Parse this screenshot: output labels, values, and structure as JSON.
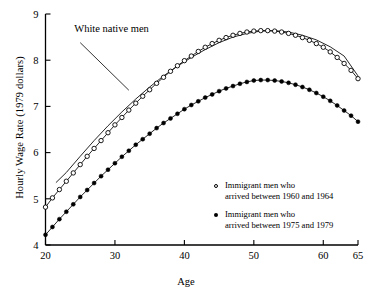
{
  "chart_data": {
    "type": "line",
    "title": "",
    "xlabel": "Age",
    "ylabel": "Hourly Wage Rate (1979 dollars)",
    "xlim": [
      20,
      65
    ],
    "ylim": [
      4,
      9
    ],
    "xticks": [
      20,
      30,
      40,
      50,
      60,
      65
    ],
    "yticks": [
      4,
      5,
      6,
      7,
      8,
      9
    ],
    "grid": false,
    "legend_position": "lower-right inside",
    "annotations": [
      {
        "text": "White native men",
        "x": 25.0,
        "y": 8.38,
        "points_to": {
          "x": 32.0,
          "y": 7.35
        }
      }
    ],
    "series": [
      {
        "name": "White native men",
        "marker": "none",
        "style": "solid-line",
        "x": [
          21.5,
          23,
          25,
          27,
          29,
          31,
          33,
          35,
          37,
          39,
          41,
          43,
          45,
          47,
          49,
          51,
          53,
          55,
          57,
          59,
          61,
          63,
          65
        ],
        "y": [
          5.35,
          5.57,
          5.92,
          6.26,
          6.58,
          6.88,
          7.16,
          7.42,
          7.66,
          7.87,
          8.06,
          8.23,
          8.38,
          8.5,
          8.58,
          8.63,
          8.64,
          8.61,
          8.54,
          8.44,
          8.29,
          8.09,
          7.66
        ]
      },
      {
        "name": "Immigrant men who arrived between 1960 and 1964",
        "marker": "open-circle",
        "style": "solid-line-with-markers",
        "x": [
          20,
          21,
          22,
          23,
          24,
          25,
          26,
          27,
          28,
          29,
          30,
          31,
          32,
          33,
          34,
          35,
          36,
          37,
          38,
          39,
          40,
          41,
          42,
          43,
          44,
          45,
          46,
          47,
          48,
          49,
          50,
          51,
          52,
          53,
          54,
          55,
          56,
          57,
          58,
          59,
          60,
          61,
          62,
          63,
          64,
          65
        ],
        "y": [
          4.82,
          5.02,
          5.2,
          5.38,
          5.56,
          5.74,
          5.92,
          6.09,
          6.26,
          6.43,
          6.6,
          6.76,
          6.92,
          7.07,
          7.22,
          7.36,
          7.5,
          7.63,
          7.76,
          7.88,
          7.99,
          8.09,
          8.19,
          8.28,
          8.36,
          8.43,
          8.49,
          8.54,
          8.58,
          8.61,
          8.63,
          8.64,
          8.64,
          8.63,
          8.61,
          8.58,
          8.54,
          8.49,
          8.43,
          8.36,
          8.28,
          8.18,
          8.06,
          7.93,
          7.78,
          7.6
        ]
      },
      {
        "name": "Immigrant men who arrived between 1975 and 1979",
        "marker": "filled-circle",
        "style": "solid-line-with-markers",
        "x": [
          20,
          21,
          22,
          23,
          24,
          25,
          26,
          27,
          28,
          29,
          30,
          31,
          32,
          33,
          34,
          35,
          36,
          37,
          38,
          39,
          40,
          41,
          42,
          43,
          44,
          45,
          46,
          47,
          48,
          49,
          50,
          51,
          52,
          53,
          54,
          55,
          56,
          57,
          58,
          59,
          60,
          61,
          62,
          63,
          64,
          65
        ],
        "y": [
          4.22,
          4.39,
          4.56,
          4.72,
          4.88,
          5.04,
          5.19,
          5.34,
          5.49,
          5.63,
          5.77,
          5.91,
          6.04,
          6.17,
          6.29,
          6.41,
          6.53,
          6.64,
          6.74,
          6.84,
          6.94,
          7.03,
          7.11,
          7.19,
          7.26,
          7.33,
          7.39,
          7.44,
          7.49,
          7.53,
          7.56,
          7.57,
          7.57,
          7.56,
          7.54,
          7.51,
          7.47,
          7.42,
          7.36,
          7.29,
          7.21,
          7.12,
          7.02,
          6.91,
          6.8,
          6.67
        ]
      }
    ]
  },
  "legend": {
    "items": [
      {
        "marker": "open-circle",
        "line1": "Immigrant men who",
        "line2": "arrived between 1960 and 1964"
      },
      {
        "marker": "filled-circle",
        "line1": "Immigrant men who",
        "line2": "arrived between 1975 and 1979"
      }
    ]
  },
  "colors": {
    "ink": "#000000",
    "background": "#ffffff"
  }
}
